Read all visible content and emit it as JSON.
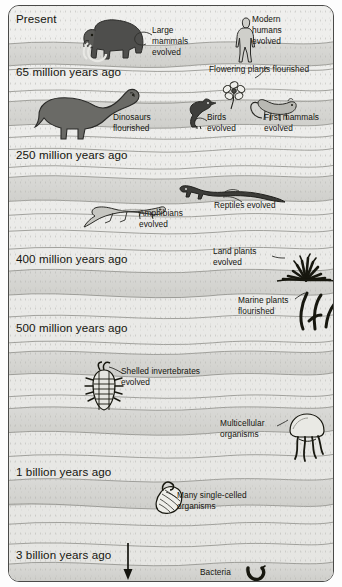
{
  "figure": {
    "type": "stratigraphic-timeline",
    "frame_color": "#4a4a48",
    "rock_light": "#ececea",
    "rock_dark": "#d5d5d2"
  },
  "era_labels": [
    {
      "id": "present",
      "text": "Present",
      "x": 16,
      "y": 13
    },
    {
      "id": "mya-65",
      "text": "65 million years ago",
      "x": 16,
      "y": 66
    },
    {
      "id": "mya-250",
      "text": "250 million years ago",
      "x": 16,
      "y": 149
    },
    {
      "id": "mya-400",
      "text": "400 million years ago",
      "x": 16,
      "y": 253
    },
    {
      "id": "mya-500",
      "text": "500 million years ago",
      "x": 16,
      "y": 322
    },
    {
      "id": "bya-1",
      "text": "1 billion years ago",
      "x": 16,
      "y": 466
    },
    {
      "id": "bya-3",
      "text": "3 billion years ago",
      "x": 16,
      "y": 549
    }
  ],
  "events": [
    {
      "id": "large-mammals",
      "text": "Large\nmammals\nevolved",
      "x": 152,
      "y": 25
    },
    {
      "id": "modern-humans",
      "text": "Modern\nhumans\nevolved",
      "x": 252,
      "y": 14
    },
    {
      "id": "flowering-plants",
      "text": "Flowering plants flourished",
      "x": 209,
      "y": 64
    },
    {
      "id": "dinosaurs",
      "text": "Dinosaurs\nflourished",
      "x": 113,
      "y": 112
    },
    {
      "id": "birds",
      "text": "Birds\nevolved",
      "x": 207,
      "y": 112
    },
    {
      "id": "first-mammals",
      "text": "First mammals\nevolved",
      "x": 264,
      "y": 112
    },
    {
      "id": "amphibians",
      "text": "Amphibians\nevolved",
      "x": 139,
      "y": 208
    },
    {
      "id": "reptiles",
      "text": "Reptiles evolved",
      "x": 214,
      "y": 200
    },
    {
      "id": "land-plants",
      "text": "Land plants\nevolved",
      "x": 213,
      "y": 246
    },
    {
      "id": "marine-plants",
      "text": "Marine plants\nflourished",
      "x": 238,
      "y": 295
    },
    {
      "id": "shelled-inverts",
      "text": "Shelled invertebrates\nevolved",
      "x": 121,
      "y": 366
    },
    {
      "id": "multicellular",
      "text": "Multicellular\norganisms",
      "x": 220,
      "y": 418
    },
    {
      "id": "single-celled",
      "text": "Many single-celled\norganisms",
      "x": 177,
      "y": 490
    },
    {
      "id": "bacteria",
      "text": "Bacteria",
      "x": 200,
      "y": 567
    }
  ],
  "organisms": [
    {
      "id": "mammoth",
      "label": "woolly mammoth",
      "x": 78,
      "y": 16
    },
    {
      "id": "human",
      "label": "modern human",
      "x": 224,
      "y": 11
    },
    {
      "id": "sauropod",
      "label": "sauropod dinosaur",
      "x": 30,
      "y": 82
    },
    {
      "id": "bird",
      "label": "bird",
      "x": 179,
      "y": 92
    },
    {
      "id": "flower",
      "label": "flowering plant",
      "x": 215,
      "y": 76
    },
    {
      "id": "early-mammal",
      "label": "first mammal",
      "x": 242,
      "y": 90
    },
    {
      "id": "reptile",
      "label": "early reptile",
      "x": 170,
      "y": 176
    },
    {
      "id": "amphibian",
      "label": "early amphibian",
      "x": 76,
      "y": 194
    },
    {
      "id": "land-plant",
      "label": "land plant clump",
      "x": 272,
      "y": 247
    },
    {
      "id": "marine-plant",
      "label": "marine algae",
      "x": 288,
      "y": 288
    },
    {
      "id": "trilobite",
      "label": "trilobite",
      "x": 79,
      "y": 357
    },
    {
      "id": "jellyfish",
      "label": "multicellular organism",
      "x": 277,
      "y": 408
    },
    {
      "id": "protist",
      "label": "single-celled organism",
      "x": 142,
      "y": 474
    },
    {
      "id": "bacterium",
      "label": "bacterium",
      "x": 238,
      "y": 562
    }
  ],
  "time_arrow": {
    "id": "time-direction-arrow",
    "x": 118,
    "y_start": 545,
    "y_end": 578,
    "direction": "downward (older)"
  }
}
